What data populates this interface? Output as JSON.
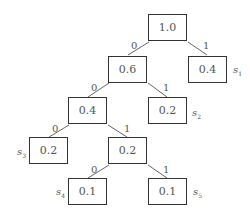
{
  "diagram": {
    "type": "binary-coding-tree",
    "nodes": [
      {
        "id": "root",
        "value": "1.0"
      },
      {
        "id": "n06",
        "value": "0.6"
      },
      {
        "id": "s1_node",
        "value": "0.4"
      },
      {
        "id": "n04",
        "value": "0.4"
      },
      {
        "id": "s2_node",
        "value": "0.2"
      },
      {
        "id": "s3_node",
        "value": "0.2"
      },
      {
        "id": "n02",
        "value": "0.2"
      },
      {
        "id": "s4_node",
        "value": "0.1"
      },
      {
        "id": "s5_node",
        "value": "0.1"
      }
    ],
    "edges": [
      {
        "from": "root",
        "to": "n06",
        "label": "0"
      },
      {
        "from": "root",
        "to": "s1_node",
        "label": "1"
      },
      {
        "from": "n06",
        "to": "n04",
        "label": "0"
      },
      {
        "from": "n06",
        "to": "s2_node",
        "label": "1"
      },
      {
        "from": "n04",
        "to": "s3_node",
        "label": "0"
      },
      {
        "from": "n04",
        "to": "n02",
        "label": "1"
      },
      {
        "from": "n02",
        "to": "s4_node",
        "label": "0"
      },
      {
        "from": "n02",
        "to": "s5_node",
        "label": "1"
      }
    ],
    "symbols": [
      {
        "letter": "s",
        "sub": "1"
      },
      {
        "letter": "s",
        "sub": "2"
      },
      {
        "letter": "s",
        "sub": "3"
      },
      {
        "letter": "s",
        "sub": "4"
      },
      {
        "letter": "s",
        "sub": "5"
      }
    ]
  }
}
